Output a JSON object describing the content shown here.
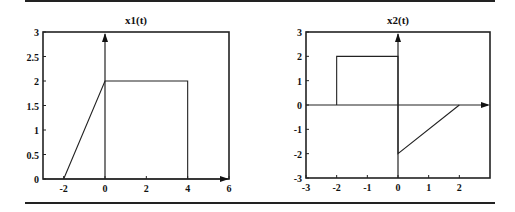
{
  "chart_data": [
    {
      "type": "line",
      "title": "x1(t)",
      "xlabel": "",
      "ylabel": "",
      "xlim": [
        -3,
        6
      ],
      "ylim": [
        0,
        3
      ],
      "xticks": [
        "-2",
        "0",
        "2",
        "4",
        "6"
      ],
      "yticks": [
        "0",
        "0.5",
        "1",
        "1.5",
        "2",
        "2.5",
        "3"
      ],
      "grid": false,
      "series": [
        {
          "name": "x1(t)",
          "x": [
            -2,
            0,
            0,
            4,
            4
          ],
          "y": [
            0,
            2,
            2,
            2,
            0
          ]
        }
      ],
      "annotations": [
        "vertical axis arrow at t=0",
        "horizontal axis arrow at y=0"
      ]
    },
    {
      "type": "line",
      "title": "x2(t)",
      "xlabel": "",
      "ylabel": "",
      "xlim": [
        -3,
        3
      ],
      "ylim": [
        -3,
        3
      ],
      "xticks": [
        "-3",
        "-2",
        "-1",
        "0",
        "1",
        "2"
      ],
      "yticks": [
        "-3",
        "-2",
        "-1",
        "0",
        "1",
        "2",
        "3"
      ],
      "grid": false,
      "series": [
        {
          "name": "x2(t)",
          "x": [
            -2,
            -2,
            0,
            0,
            2
          ],
          "y": [
            0,
            2,
            2,
            -2,
            0
          ]
        }
      ],
      "annotations": [
        "vertical axis arrow at t=0",
        "horizontal axis arrow at y=0"
      ]
    }
  ],
  "plots": [
    {
      "title": "x1(t)"
    },
    {
      "title": "x2(t)"
    }
  ]
}
